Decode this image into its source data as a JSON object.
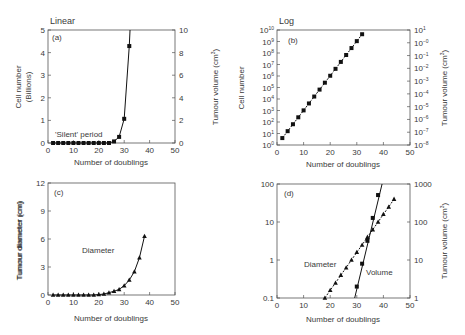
{
  "chart_data": [
    {
      "id": "a",
      "panel_label": "(a)",
      "heading": "Linear",
      "type": "line",
      "xlabel": "Number of doublings",
      "ylabel": "Cell number (Billions)",
      "ylabel_line1": "Cell number",
      "ylabel_line2": "(Billions)",
      "y2label": "Tumour volume (cm³)",
      "xlim": [
        0,
        50
      ],
      "ylim": [
        0,
        5
      ],
      "y2lim": [
        0,
        10
      ],
      "xticks": [
        "0",
        "10",
        "20",
        "30",
        "40",
        "50"
      ],
      "yticks": [
        "0",
        "1",
        "2",
        "3",
        "4",
        "5"
      ],
      "y2ticks": [
        "0",
        "2",
        "4",
        "6",
        "8",
        "10"
      ],
      "annotation": "'Silent' period",
      "series": [
        {
          "name": "Cell number",
          "marker": "square",
          "x": [
            2,
            4,
            6,
            8,
            10,
            12,
            14,
            16,
            18,
            20,
            22,
            24,
            26,
            28,
            30,
            32
          ],
          "values": [
            0,
            0,
            0,
            0,
            0,
            0,
            0,
            0,
            0,
            0,
            0,
            0,
            0.07,
            0.27,
            1.07,
            4.29
          ]
        }
      ]
    },
    {
      "id": "b",
      "panel_label": "(b)",
      "heading": "Log",
      "type": "line",
      "xlabel": "Number of doublings",
      "ylabel": "Cell number",
      "y2label": "Tumour volume (cm³)",
      "xlim": [
        0,
        50
      ],
      "ylim_log10": [
        0,
        10
      ],
      "y2lim_log10": [
        -9,
        1
      ],
      "xticks": [
        "0",
        "10",
        "20",
        "30",
        "40",
        "50"
      ],
      "yticks": [
        "10^0",
        "10^1",
        "10^2",
        "10^3",
        "10^4",
        "10^5",
        "10^6",
        "10^7",
        "10^8",
        "10^9",
        "10^10"
      ],
      "y2ticks": [
        "10^-8",
        "10^-7",
        "10^-6",
        "10^-5",
        "10^-4",
        "10^-3",
        "10^-2",
        "10^-1",
        "10^-0",
        "10^1"
      ],
      "series": [
        {
          "name": "Cell number",
          "marker": "square",
          "scale": "log",
          "x": [
            2,
            4,
            6,
            8,
            10,
            12,
            14,
            16,
            18,
            20,
            22,
            24,
            26,
            28,
            30,
            32
          ],
          "values": [
            4,
            16,
            64,
            256,
            1024,
            4096,
            16384,
            65536,
            262144,
            1048576,
            4194304,
            16777216,
            67108864,
            268435456,
            1073741824,
            4294967296
          ]
        }
      ]
    },
    {
      "id": "c",
      "panel_label": "(c)",
      "type": "line",
      "xlabel": "Number of doublings",
      "ylabel": "Tumour diameter (cm)",
      "xlim": [
        0,
        50
      ],
      "ylim": [
        0,
        12
      ],
      "xticks": [
        "0",
        "10",
        "20",
        "30",
        "40",
        "50"
      ],
      "yticks": [
        "0",
        "3",
        "6",
        "9",
        "12"
      ],
      "annotation": "Diameter",
      "series": [
        {
          "name": "Diameter",
          "marker": "triangle",
          "x": [
            2,
            4,
            6,
            8,
            10,
            12,
            14,
            16,
            18,
            20,
            22,
            24,
            26,
            28,
            30,
            32,
            34,
            36,
            38
          ],
          "values": [
            0,
            0,
            0,
            0,
            0,
            0,
            0,
            0,
            0,
            0.05,
            0.1,
            0.25,
            0.4,
            0.6,
            1.0,
            1.6,
            2.5,
            4.0,
            6.3,
            10.0
          ]
        }
      ]
    },
    {
      "id": "d",
      "panel_label": "(d)",
      "type": "line",
      "xlabel": "Number of doublings",
      "ylabel": "Tumour diameter (cm)",
      "y2label": "Tumour volume (cm³)",
      "xlim": [
        0,
        50
      ],
      "ylim": [
        0.1,
        100
      ],
      "y2lim": [
        1,
        1000
      ],
      "yscale": "log",
      "xticks": [
        "0",
        "10",
        "20",
        "30",
        "40",
        "50"
      ],
      "yticks": [
        "0.1",
        "1",
        "10",
        "100"
      ],
      "y2ticks": [
        "1",
        "10",
        "100",
        "1000"
      ],
      "series": [
        {
          "name": "Diameter",
          "marker": "triangle",
          "axis": "left",
          "x": [
            18,
            20,
            22,
            24,
            26,
            28,
            30,
            32,
            34,
            36,
            38,
            40,
            42,
            44
          ],
          "values": [
            0.1,
            0.16,
            0.25,
            0.4,
            0.63,
            1.0,
            1.6,
            2.5,
            4.0,
            6.3,
            10,
            16,
            25,
            40
          ]
        },
        {
          "name": "Volume",
          "marker": "square",
          "axis": "right",
          "x": [
            30,
            32,
            34,
            36,
            38
          ],
          "values": [
            2,
            8,
            32,
            128,
            512
          ]
        }
      ]
    }
  ],
  "labels": {
    "a_heading": "Linear",
    "a_panel": "(a)",
    "a_ylabel1": "Cell number",
    "a_ylabel2": "(Billions)",
    "a_y2label": "Tumour volume (cm",
    "a_xlabel": "Number of doublings",
    "a_annotation": "'Silent' period",
    "b_heading": "Log",
    "b_panel": "(b)",
    "b_ylabel": "Cell number",
    "b_y2label": "Tumour volume (cm",
    "b_xlabel": "Number of doublings",
    "c_panel": "(c)",
    "c_ylabel": "Tumour diameter (cm)",
    "c_xlabel": "Number of doublings",
    "c_annotation": "Diameter",
    "d_panel": "(d)",
    "d_ylabel": "Tumour diameter (cm)",
    "d_y2label": "Tumour volume (cm",
    "d_xlabel": "Number of doublings",
    "d_annotation_diameter": "Diameter",
    "d_annotation_volume": "Volume",
    "cube": "3",
    "close_paren": ")"
  }
}
